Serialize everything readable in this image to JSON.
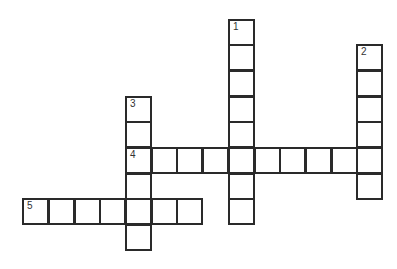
{
  "puzzle": {
    "type": "crossword",
    "cell_size": 25.7,
    "origin": {
      "x": 125,
      "y": 147
    },
    "colors": {
      "border": "#2a2a2a",
      "fill": "#ffffff",
      "number": "#333333"
    },
    "words": [
      {
        "number": "1",
        "direction": "down",
        "col": 4,
        "row": -5,
        "length": 8
      },
      {
        "number": "2",
        "direction": "down",
        "col": 9,
        "row": -4,
        "length": 6
      },
      {
        "number": "3",
        "direction": "down",
        "col": 0,
        "row": -2,
        "length": 6
      },
      {
        "number": "4",
        "direction": "across",
        "col": 0,
        "row": 0,
        "length": 10
      },
      {
        "number": "5",
        "direction": "across",
        "col": -4,
        "row": 2,
        "length": 7
      }
    ]
  }
}
